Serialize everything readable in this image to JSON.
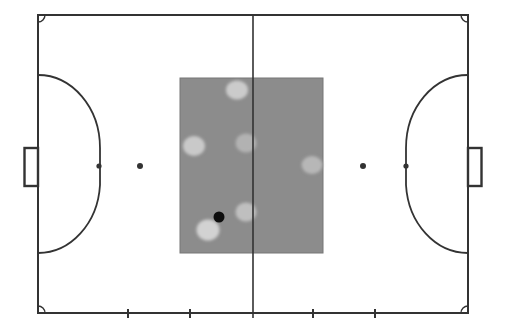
{
  "diagram": {
    "kind": "futsal-pitch-with-heat-overlay",
    "canvas": {
      "width": 505,
      "height": 335,
      "background": "#ffffff"
    },
    "pitch": {
      "line_color": "#333333",
      "boundary": {
        "x": 38,
        "y": 15,
        "width": 430,
        "height": 298,
        "stroke_width": 2
      },
      "halfway_line": {
        "x": 253,
        "y1": 15,
        "y2": 318,
        "stroke_width": 1.6
      },
      "corner_arc_radius": 7,
      "penalty_areas": [
        {
          "side": "left",
          "goal_line_x": 38,
          "apex_x": 100,
          "top_y": 75,
          "bottom_y": 253,
          "flat_top_y": 148,
          "flat_bottom_y": 185
        },
        {
          "side": "right",
          "goal_line_x": 468,
          "apex_x": 406,
          "top_y": 75,
          "bottom_y": 253,
          "flat_top_y": 148,
          "flat_bottom_y": 185
        }
      ],
      "goals": [
        {
          "side": "left",
          "x": 24.5,
          "y": 148,
          "width": 13.5,
          "height": 38
        },
        {
          "side": "right",
          "x": 468,
          "y": 148,
          "width": 13.5,
          "height": 38
        }
      ],
      "spots": [
        {
          "name": "left-penalty-spot",
          "cx": 99,
          "cy": 166,
          "r": 2.6
        },
        {
          "name": "left-second-penalty-spot",
          "cx": 140,
          "cy": 166,
          "r": 3.0
        },
        {
          "name": "right-second-penalty-spot",
          "cx": 363,
          "cy": 166,
          "r": 3.0
        },
        {
          "name": "right-penalty-spot",
          "cx": 406,
          "cy": 166,
          "r": 2.6
        }
      ],
      "substitution_ticks": {
        "xs": [
          128,
          190,
          313,
          375
        ],
        "y1": 309,
        "y2": 318,
        "stroke_width": 2
      }
    },
    "overlay": {
      "zone_rect": {
        "x": 180,
        "y": 78,
        "width": 143,
        "height": 175,
        "fill": "#8c8c8c",
        "edge_color": "#777777"
      },
      "heat_blobs": [
        {
          "cx": 237,
          "cy": 90,
          "rx": 11.0,
          "ry": 9.5,
          "fill": "#cbcbcb"
        },
        {
          "cx": 194,
          "cy": 146,
          "rx": 11.0,
          "ry": 10.0,
          "fill": "#c9c9c9"
        },
        {
          "cx": 246,
          "cy": 143,
          "rx": 10.5,
          "ry": 9.5,
          "fill": "#b2b2b2"
        },
        {
          "cx": 312,
          "cy": 165,
          "rx": 10.5,
          "ry": 9.0,
          "fill": "#b7b7b7"
        },
        {
          "cx": 246,
          "cy": 212,
          "rx": 10.5,
          "ry": 9.5,
          "fill": "#bfbfbf"
        },
        {
          "cx": 208,
          "cy": 230,
          "rx": 11.5,
          "ry": 10.5,
          "fill": "#d2d2d2"
        }
      ],
      "ball_marker": {
        "cx": 219,
        "cy": 217,
        "r": 5.5,
        "fill": "#0d0d0d"
      }
    }
  }
}
